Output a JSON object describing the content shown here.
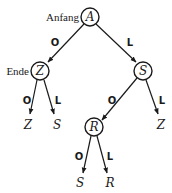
{
  "diagram": {
    "type": "decision-tree",
    "nodes": [
      {
        "id": "A",
        "label": "A",
        "circled": true,
        "side_label": "Anfang"
      },
      {
        "id": "Z1",
        "label": "Z",
        "circled": true,
        "side_label": "Ende"
      },
      {
        "id": "S1",
        "label": "S",
        "circled": true
      },
      {
        "id": "R1",
        "label": "R",
        "circled": true
      },
      {
        "id": "Z2",
        "label": "Z",
        "circled": false
      },
      {
        "id": "S2",
        "label": "S",
        "circled": false
      },
      {
        "id": "Z3",
        "label": "Z",
        "circled": false
      },
      {
        "id": "S3",
        "label": "S",
        "circled": false
      },
      {
        "id": "R2",
        "label": "R",
        "circled": false
      }
    ],
    "edges": [
      {
        "from": "A",
        "to": "Z1",
        "label": "O"
      },
      {
        "from": "A",
        "to": "S1",
        "label": "L"
      },
      {
        "from": "Z1",
        "to": "Z2",
        "label": "O"
      },
      {
        "from": "Z1",
        "to": "S2",
        "label": "L"
      },
      {
        "from": "S1",
        "to": "R1",
        "label": "O"
      },
      {
        "from": "S1",
        "to": "Z3",
        "label": "L"
      },
      {
        "from": "R1",
        "to": "S3",
        "label": "O"
      },
      {
        "from": "R1",
        "to": "R2",
        "label": "L"
      }
    ]
  },
  "labels": {
    "anfang": "Anfang",
    "ende": "Ende",
    "node_A": "A",
    "node_Z1": "Z",
    "node_S1": "S",
    "node_R1": "R",
    "leaf_Z2": "Z",
    "leaf_S2": "S",
    "leaf_Z3": "Z",
    "leaf_S3": "S",
    "leaf_R2": "R",
    "edge_A_Z1": "O",
    "edge_A_S1": "L",
    "edge_Z1_Z2": "O",
    "edge_Z1_S2": "L",
    "edge_S1_R1": "O",
    "edge_S1_Z3": "L",
    "edge_R1_S3": "O",
    "edge_R1_R2": "L"
  }
}
